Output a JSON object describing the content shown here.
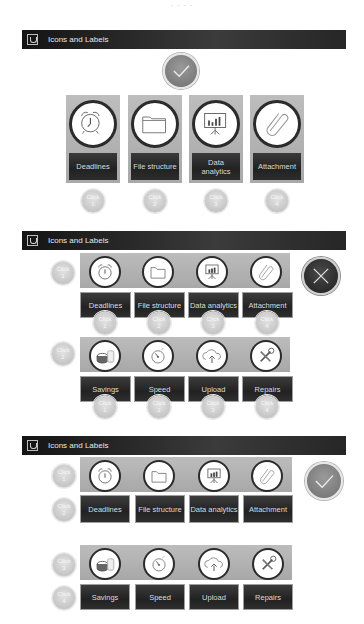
{
  "top_caption": "- - - -",
  "sections": [
    {
      "header": {
        "title": "Icons and Labels",
        "icon": "logo-icon"
      },
      "status": {
        "type": "correct",
        "icon": "checkmark-icon"
      },
      "items": [
        {
          "label": "Deadlines",
          "icon": "alarm-clock-icon",
          "badge": [
            "Click",
            "1"
          ]
        },
        {
          "label": "File structure",
          "icon": "folder-icon",
          "badge": [
            "Click",
            "2"
          ]
        },
        {
          "label": "Data analytics",
          "icon": "presentation-chart-icon",
          "badge": [
            "Click",
            "3"
          ]
        },
        {
          "label": "Attachment",
          "icon": "paperclip-icon",
          "badge": [
            "Click",
            "4"
          ]
        }
      ]
    },
    {
      "header": {
        "title": "Icons and Labels",
        "icon": "logo-icon"
      },
      "status": {
        "type": "incorrect",
        "icon": "x-icon"
      },
      "row_badges": [
        [
          "Click",
          "1"
        ],
        [
          "Click",
          "2"
        ]
      ],
      "rows": [
        {
          "items": [
            {
              "label": "Deadlines",
              "icon": "alarm-clock-icon",
              "badge": [
                "Click",
                "1"
              ]
            },
            {
              "label": "File structure",
              "icon": "folder-icon",
              "badge": [
                "Click",
                "2"
              ]
            },
            {
              "label": "Data analytics",
              "icon": "presentation-chart-icon",
              "badge": [
                "Click",
                "3"
              ]
            },
            {
              "label": "Attachment",
              "icon": "paperclip-icon",
              "badge": [
                "Click",
                "4"
              ]
            }
          ]
        },
        {
          "items": [
            {
              "label": "Savings",
              "icon": "coins-jar-icon",
              "badge": [
                "Click",
                "1"
              ]
            },
            {
              "label": "Speed",
              "icon": "stopwatch-icon",
              "badge": [
                "Click",
                "2"
              ]
            },
            {
              "label": "Upload",
              "icon": "cloud-upload-icon",
              "badge": [
                "Click",
                "3"
              ]
            },
            {
              "label": "Repairs",
              "icon": "tools-icon",
              "badge": [
                "Click",
                "4"
              ]
            }
          ]
        }
      ]
    },
    {
      "header": {
        "title": "Icons and Labels",
        "icon": "logo-icon"
      },
      "status": {
        "type": "correct",
        "icon": "checkmark-icon"
      },
      "row_badges": [
        [
          "Click",
          "1"
        ],
        [
          "Click",
          "2"
        ],
        [
          "Click",
          "3"
        ],
        [
          "Click",
          "4"
        ]
      ],
      "rows": [
        {
          "items": [
            {
              "label": "Deadlines",
              "icon": "alarm-clock-icon"
            },
            {
              "label": "File structure",
              "icon": "folder-icon"
            },
            {
              "label": "Data analytics",
              "icon": "presentation-chart-icon"
            },
            {
              "label": "Attachment",
              "icon": "paperclip-icon"
            }
          ]
        },
        {
          "items": [
            {
              "label": "Savings",
              "icon": "coins-jar-icon"
            },
            {
              "label": "Speed",
              "icon": "stopwatch-icon"
            },
            {
              "label": "Upload",
              "icon": "cloud-upload-icon"
            },
            {
              "label": "Repairs",
              "icon": "tools-icon"
            }
          ]
        }
      ]
    }
  ],
  "colors": {
    "header_bg": "#262626",
    "card_bg": "#b3b3b3",
    "label_bg": "#2a2a2a",
    "status_correct": "#8a8a8a",
    "status_incorrect": "#2e2e2e"
  }
}
